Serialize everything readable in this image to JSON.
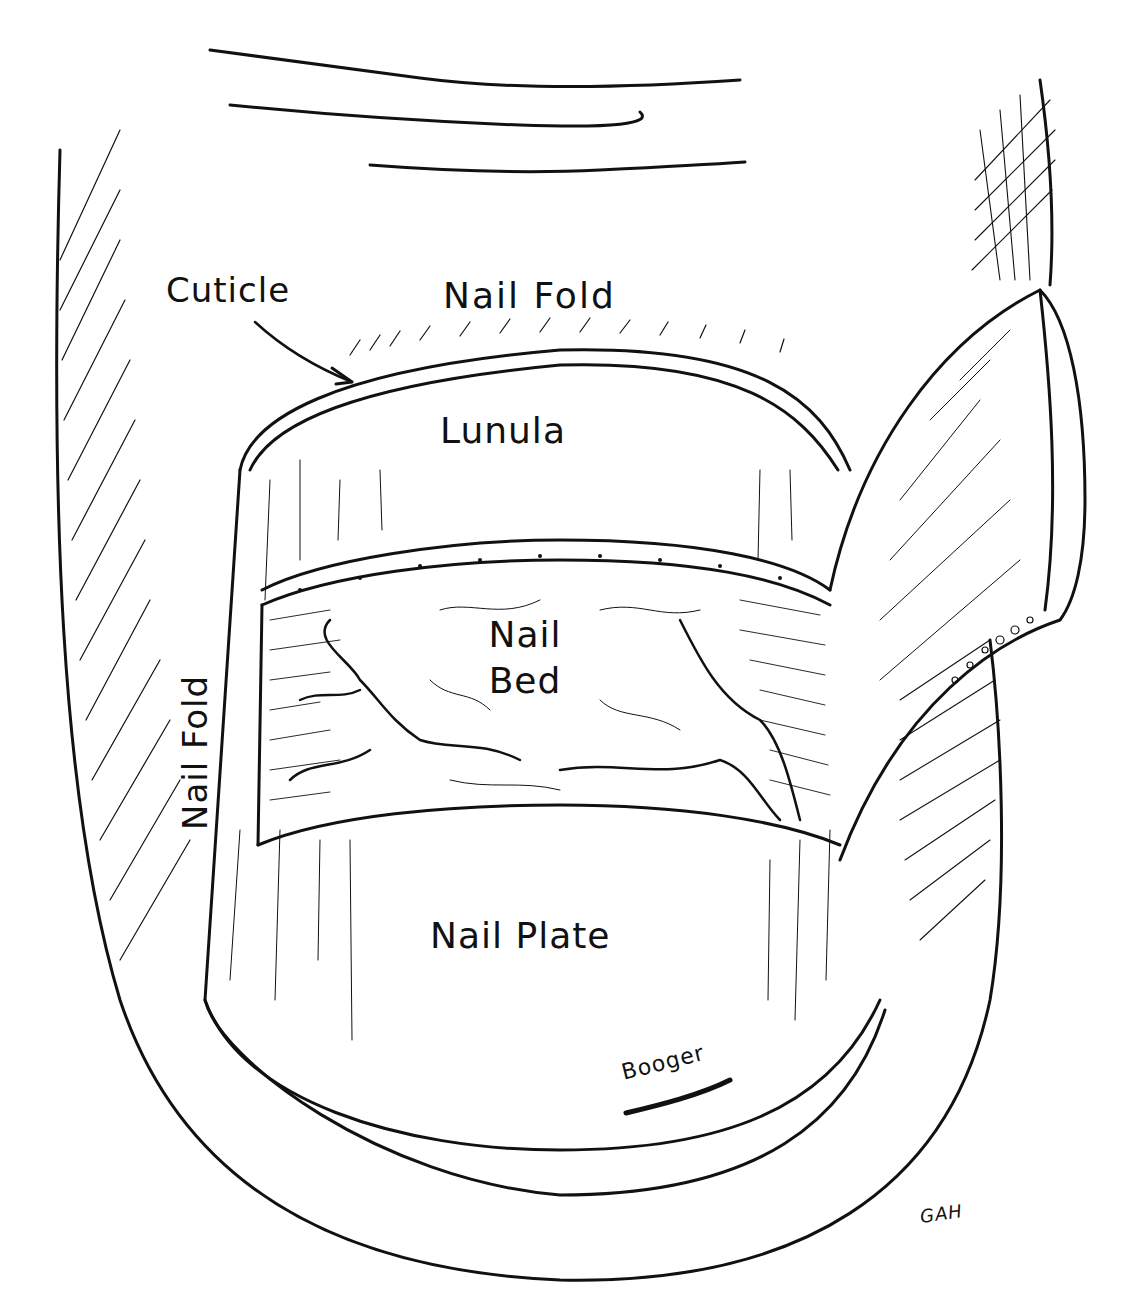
{
  "figure": {
    "style": "black ink pen-and-hatching drawing on white",
    "ink_color": "#111111",
    "background_color": "#ffffff"
  },
  "labels": {
    "cuticle": "Cuticle",
    "nail_fold_top": "Nail  Fold",
    "lunula": "Lunula",
    "nail_bed_line1": "Nail",
    "nail_bed_line2": "Bed",
    "nail_fold_side": "Nail Fold",
    "nail_plate": "Nail Plate",
    "booger": "Booger",
    "signature": "GAH"
  },
  "annotations": [
    {
      "id": "cuticle-arrow",
      "from_label": "Cuticle",
      "points_to": "cuticle edge at top of lunula"
    }
  ]
}
